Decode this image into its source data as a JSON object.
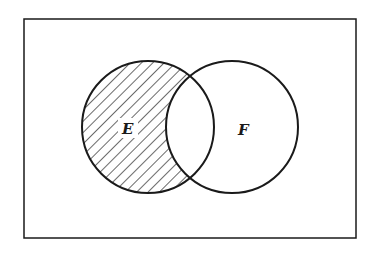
{
  "diagram": {
    "type": "venn",
    "universe": {
      "x": 24,
      "y": 19,
      "width": 332,
      "height": 219
    },
    "sets": [
      {
        "label": "E",
        "cx": 148,
        "cy": 127,
        "r": 66,
        "label_x": 128,
        "label_y": 133
      },
      {
        "label": "F",
        "cx": 232,
        "cy": 127,
        "r": 66,
        "label_x": 243,
        "label_y": 135
      }
    ],
    "shaded_region": "E minus F",
    "colors": {
      "stroke": "#1a1a1a",
      "background": "#ffffff",
      "hatch": "#1a1a1a"
    }
  }
}
